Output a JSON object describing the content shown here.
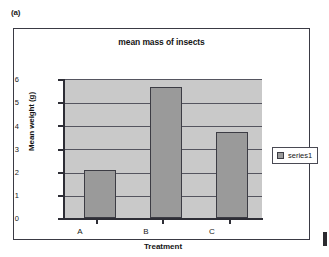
{
  "figure": {
    "label": "(a)"
  },
  "chart_data": {
    "type": "bar",
    "title": "mean mass of insects",
    "categories": [
      "A",
      "B",
      "C"
    ],
    "values": [
      2.1,
      5.7,
      3.75
    ],
    "series": [
      {
        "name": "series1",
        "values": [
          2.1,
          5.7,
          3.75
        ]
      }
    ],
    "xlabel": "Treatment",
    "ylabel": "Mean weight (g)",
    "ylim": [
      0,
      6
    ],
    "ytick_step": 1,
    "yticks": [
      "6",
      "5",
      "4",
      "3",
      "2",
      "1",
      "0"
    ],
    "grid": true,
    "legend_position": "right",
    "colors": {
      "bar_fill": "#9a9a9a",
      "bar_border": "#3c3c44",
      "plot_background": "#c9c9c9",
      "gridline": "#55555f",
      "axis": "#2e2e36",
      "frame_border": "#3a3a44",
      "text": "#161616",
      "page_background": "#ffffff"
    }
  }
}
